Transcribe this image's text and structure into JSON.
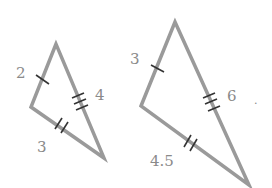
{
  "figure": {
    "colors": {
      "edge": "#9a9a9a",
      "tick": "#333333",
      "label": "#8a8a8a"
    },
    "small_triangle": {
      "side_short": "2",
      "side_long": "4",
      "side_mid": "3",
      "ticks": {
        "short": 1,
        "long": 3,
        "mid": 2
      }
    },
    "large_triangle": {
      "side_short": "3",
      "side_long": "6",
      "side_mid": "4.5",
      "ticks": {
        "short": 1,
        "long": 3,
        "mid": 2
      }
    },
    "stray_mark": "."
  }
}
